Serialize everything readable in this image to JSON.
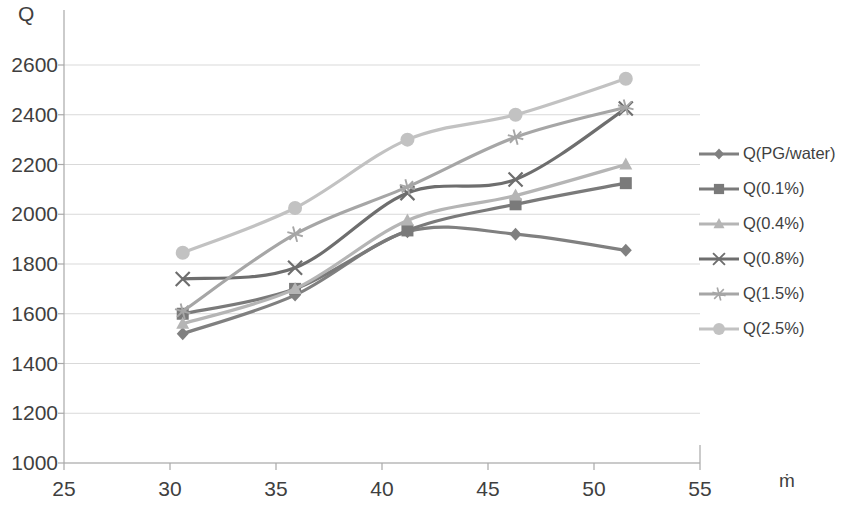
{
  "chart_data": {
    "type": "line",
    "title": "",
    "xlabel": "ṁ",
    "ylabel": "Q",
    "xlim": [
      25,
      55
    ],
    "ylim": [
      1000,
      2600
    ],
    "xticks": [
      25,
      30,
      35,
      40,
      45,
      50,
      55
    ],
    "yticks": [
      1000,
      1200,
      1400,
      1600,
      1800,
      2000,
      2200,
      2400,
      2600
    ],
    "grid": "horizontal",
    "legend_position": "right",
    "x": [
      30.6,
      35.9,
      41.2,
      46.3,
      51.5
    ],
    "series": [
      {
        "name": "Q(PG/water)",
        "marker": "diamond",
        "color": "#808080",
        "values": [
          1520,
          1675,
          1930,
          1920,
          1855
        ]
      },
      {
        "name": "Q(0.1%)",
        "marker": "square",
        "color": "#7a7a7a",
        "values": [
          1600,
          1700,
          1935,
          2040,
          2125
        ]
      },
      {
        "name": "Q(0.4%)",
        "marker": "triangle",
        "color": "#b5b5b5",
        "values": [
          1560,
          1700,
          1975,
          2075,
          2200
        ]
      },
      {
        "name": "Q(0.8%)",
        "marker": "cross",
        "color": "#6e6e6e",
        "values": [
          1740,
          1785,
          2085,
          2140,
          2425
        ]
      },
      {
        "name": "Q(1.5%)",
        "marker": "asterisk",
        "color": "#a6a6a6",
        "values": [
          1610,
          1920,
          2110,
          2310,
          2430
        ]
      },
      {
        "name": "Q(2.5%)",
        "marker": "circle",
        "color": "#c2c2c2",
        "values": [
          1845,
          2025,
          2300,
          2400,
          2545
        ]
      }
    ]
  },
  "legend": {
    "items": [
      {
        "label": "Q(PG/water)"
      },
      {
        "label": "Q(0.1%)"
      },
      {
        "label": "Q(0.4%)"
      },
      {
        "label": "Q(0.8%)"
      },
      {
        "label": "Q(1.5%)"
      },
      {
        "label": "Q(2.5%)"
      }
    ]
  },
  "colors": {
    "axis": "#a8a8a8",
    "grid": "#d9d9d9",
    "text": "#3f3f3f",
    "background": "#ffffff"
  }
}
